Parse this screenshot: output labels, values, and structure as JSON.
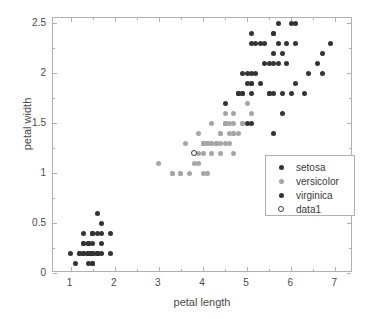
{
  "chart_data": {
    "type": "scatter",
    "title": "",
    "xlabel": "petal length",
    "ylabel": "petal width",
    "xlim": [
      0.6,
      7.4
    ],
    "ylim": [
      0.0,
      2.55
    ],
    "xticks": [
      "1",
      "2",
      "3",
      "4",
      "5",
      "6",
      "7"
    ],
    "xtick_values": [
      1,
      2,
      3,
      4,
      5,
      6,
      7
    ],
    "yticks": [
      "0",
      "0.5",
      "1",
      "1.5",
      "2",
      "2.5"
    ],
    "ytick_values": [
      0,
      0.5,
      1,
      1.5,
      2,
      2.5
    ],
    "grid": false,
    "legend_position": "center-right",
    "legend_entries": [
      "setosa",
      "versicolor",
      "virginica",
      "data1"
    ],
    "colors": {
      "setosa": "#333333",
      "versicolor": "#a6a6a6",
      "virginica": "#333333",
      "data1": "#ffffff",
      "data1_edge": "#3a3a3a",
      "axis": "#b0b0b0",
      "text": "#4a4a4a",
      "background": "#ffffff"
    },
    "series": [
      {
        "name": "setosa",
        "marker": "filled-circle",
        "color": "#333333",
        "points": [
          [
            1.4,
            0.2
          ],
          [
            1.4,
            0.2
          ],
          [
            1.3,
            0.2
          ],
          [
            1.5,
            0.2
          ],
          [
            1.4,
            0.2
          ],
          [
            1.7,
            0.4
          ],
          [
            1.4,
            0.3
          ],
          [
            1.5,
            0.2
          ],
          [
            1.4,
            0.2
          ],
          [
            1.5,
            0.1
          ],
          [
            1.5,
            0.2
          ],
          [
            1.6,
            0.2
          ],
          [
            1.4,
            0.1
          ],
          [
            1.1,
            0.1
          ],
          [
            1.2,
            0.2
          ],
          [
            1.5,
            0.4
          ],
          [
            1.3,
            0.4
          ],
          [
            1.4,
            0.3
          ],
          [
            1.7,
            0.3
          ],
          [
            1.5,
            0.3
          ],
          [
            1.7,
            0.2
          ],
          [
            1.5,
            0.4
          ],
          [
            1.0,
            0.2
          ],
          [
            1.7,
            0.5
          ],
          [
            1.9,
            0.2
          ],
          [
            1.6,
            0.2
          ],
          [
            1.6,
            0.4
          ],
          [
            1.5,
            0.2
          ],
          [
            1.4,
            0.2
          ],
          [
            1.6,
            0.2
          ],
          [
            1.6,
            0.2
          ],
          [
            1.5,
            0.4
          ],
          [
            1.5,
            0.1
          ],
          [
            1.4,
            0.2
          ],
          [
            1.5,
            0.2
          ],
          [
            1.2,
            0.2
          ],
          [
            1.3,
            0.2
          ],
          [
            1.5,
            0.1
          ],
          [
            1.3,
            0.2
          ],
          [
            1.5,
            0.2
          ],
          [
            1.3,
            0.3
          ],
          [
            1.3,
            0.3
          ],
          [
            1.3,
            0.2
          ],
          [
            1.6,
            0.6
          ],
          [
            1.9,
            0.4
          ],
          [
            1.4,
            0.3
          ],
          [
            1.6,
            0.2
          ],
          [
            1.4,
            0.2
          ],
          [
            1.5,
            0.2
          ],
          [
            1.4,
            0.2
          ]
        ]
      },
      {
        "name": "versicolor",
        "marker": "filled-circle",
        "color": "#a6a6a6",
        "points": [
          [
            4.7,
            1.4
          ],
          [
            4.5,
            1.5
          ],
          [
            4.9,
            1.5
          ],
          [
            4.0,
            1.3
          ],
          [
            4.6,
            1.5
          ],
          [
            4.5,
            1.3
          ],
          [
            4.7,
            1.6
          ],
          [
            3.3,
            1.0
          ],
          [
            4.6,
            1.3
          ],
          [
            3.9,
            1.4
          ],
          [
            3.5,
            1.0
          ],
          [
            4.2,
            1.5
          ],
          [
            4.0,
            1.0
          ],
          [
            4.7,
            1.4
          ],
          [
            3.6,
            1.3
          ],
          [
            4.4,
            1.4
          ],
          [
            4.5,
            1.5
          ],
          [
            4.1,
            1.0
          ],
          [
            4.5,
            1.5
          ],
          [
            3.9,
            1.1
          ],
          [
            4.8,
            1.8
          ],
          [
            4.0,
            1.3
          ],
          [
            4.9,
            1.5
          ],
          [
            4.7,
            1.2
          ],
          [
            4.3,
            1.3
          ],
          [
            4.4,
            1.4
          ],
          [
            4.8,
            1.4
          ],
          [
            5.0,
            1.7
          ],
          [
            4.5,
            1.5
          ],
          [
            3.5,
            1.0
          ],
          [
            3.8,
            1.1
          ],
          [
            3.7,
            1.0
          ],
          [
            3.9,
            1.2
          ],
          [
            5.1,
            1.6
          ],
          [
            4.5,
            1.5
          ],
          [
            4.5,
            1.6
          ],
          [
            4.7,
            1.5
          ],
          [
            4.4,
            1.3
          ],
          [
            4.1,
            1.3
          ],
          [
            4.0,
            1.3
          ],
          [
            4.4,
            1.2
          ],
          [
            4.6,
            1.4
          ],
          [
            4.0,
            1.2
          ],
          [
            3.3,
            1.0
          ],
          [
            4.2,
            1.3
          ],
          [
            4.2,
            1.2
          ],
          [
            4.2,
            1.3
          ],
          [
            4.3,
            1.3
          ],
          [
            3.0,
            1.1
          ],
          [
            4.1,
            1.3
          ]
        ]
      },
      {
        "name": "virginica",
        "marker": "filled-circle",
        "color": "#333333",
        "points": [
          [
            6.0,
            2.5
          ],
          [
            5.1,
            1.9
          ],
          [
            5.9,
            2.1
          ],
          [
            5.6,
            1.8
          ],
          [
            5.8,
            2.2
          ],
          [
            6.6,
            2.1
          ],
          [
            4.5,
            1.7
          ],
          [
            6.3,
            1.8
          ],
          [
            5.8,
            1.8
          ],
          [
            6.1,
            2.5
          ],
          [
            5.1,
            2.0
          ],
          [
            5.3,
            1.9
          ],
          [
            5.5,
            2.1
          ],
          [
            5.0,
            2.0
          ],
          [
            5.1,
            2.4
          ],
          [
            5.3,
            2.3
          ],
          [
            5.5,
            1.8
          ],
          [
            6.7,
            2.2
          ],
          [
            6.9,
            2.3
          ],
          [
            5.0,
            1.5
          ],
          [
            5.7,
            2.3
          ],
          [
            4.9,
            2.0
          ],
          [
            6.7,
            2.0
          ],
          [
            4.9,
            1.8
          ],
          [
            5.7,
            2.1
          ],
          [
            6.0,
            1.8
          ],
          [
            4.8,
            1.8
          ],
          [
            4.9,
            1.8
          ],
          [
            5.6,
            2.1
          ],
          [
            5.8,
            1.6
          ],
          [
            6.1,
            1.9
          ],
          [
            6.4,
            2.0
          ],
          [
            5.6,
            2.2
          ],
          [
            5.1,
            1.5
          ],
          [
            5.6,
            1.4
          ],
          [
            6.1,
            2.3
          ],
          [
            5.6,
            2.4
          ],
          [
            5.5,
            1.8
          ],
          [
            4.8,
            1.8
          ],
          [
            5.4,
            2.1
          ],
          [
            5.6,
            2.4
          ],
          [
            5.1,
            2.3
          ],
          [
            5.1,
            1.9
          ],
          [
            5.9,
            2.3
          ],
          [
            5.7,
            2.5
          ],
          [
            5.2,
            2.3
          ],
          [
            5.0,
            1.9
          ],
          [
            5.2,
            2.0
          ],
          [
            5.4,
            2.3
          ],
          [
            5.1,
            1.8
          ]
        ]
      },
      {
        "name": "data1",
        "marker": "open-circle",
        "color": "#ffffff",
        "points": [
          [
            3.8,
            1.2
          ]
        ]
      }
    ]
  }
}
